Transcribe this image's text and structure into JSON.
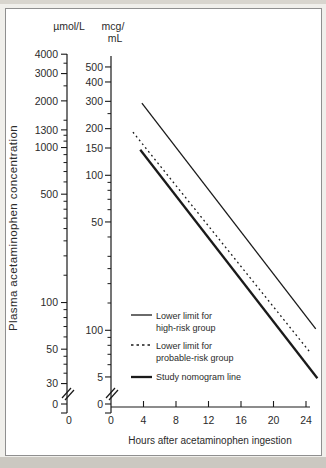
{
  "colors": {
    "line": "#1a1a1a",
    "text": "#2b2b2b",
    "frame": "#8f8f8f",
    "figure_bg": "#ffffff",
    "page_bg": "#f0efeb"
  },
  "chart_data": {
    "type": "line",
    "title": "",
    "y_scale": "log",
    "y_axis_title": "Plasma acetaminophen concentration",
    "y_axes": [
      {
        "unit_label": "µmol/L",
        "tick_labels": [
          "4000",
          "3000",
          "2000",
          "1300",
          "1000",
          "500",
          "100",
          "50",
          "30",
          "0"
        ],
        "tick_values": [
          4000,
          3000,
          2000,
          1300,
          1000,
          500,
          100,
          50,
          30,
          0
        ],
        "minor_tick_values": [
          3500,
          2500,
          1500,
          1200,
          1100,
          900,
          800,
          700,
          600,
          450,
          400,
          350,
          300,
          250,
          200,
          150,
          90,
          80,
          70,
          60,
          45,
          40,
          35
        ],
        "axis_break_above_zero": true
      },
      {
        "unit_lines": [
          "mcg/",
          "mL"
        ],
        "tick_labels": [
          "500",
          "400",
          "300",
          "200",
          "150",
          "100",
          "50",
          "100",
          "5",
          "0"
        ],
        "tick_values": [
          500,
          400,
          300,
          200,
          150,
          100,
          50,
          10,
          5,
          0
        ],
        "minor_tick_values": [
          250,
          90,
          80,
          70,
          60,
          40,
          30,
          25,
          20,
          15,
          9,
          8,
          7,
          6
        ],
        "axis_break_above_zero": true
      }
    ],
    "x_axis": {
      "title": "Hours after acetaminophen ingestion",
      "tick_labels": [
        "0",
        "4",
        "8",
        "12",
        "16",
        "20",
        "24"
      ],
      "tick_values": [
        0,
        4,
        8,
        12,
        16,
        20,
        24
      ],
      "range_hours": [
        0,
        24
      ],
      "extra_zero_label_under_umol_axis": "0"
    },
    "series": [
      {
        "name": "Lower limit for high-risk group",
        "style": "solid-thin",
        "points": [
          {
            "hours": 3.8,
            "mcg_per_ml": 292
          },
          {
            "hours": 25.2,
            "mcg_per_ml": 10.2
          }
        ]
      },
      {
        "name": "Lower limit for probable-risk group",
        "style": "dashed",
        "points": [
          {
            "hours": 2.7,
            "mcg_per_ml": 190
          },
          {
            "hours": 24.6,
            "mcg_per_ml": 7.1
          }
        ]
      },
      {
        "name": "Study nomogram line",
        "style": "solid-thick",
        "points": [
          {
            "hours": 3.6,
            "mcg_per_ml": 146
          },
          {
            "hours": 25.4,
            "mcg_per_ml": 4.9
          }
        ]
      }
    ],
    "legend": {
      "position": "lower-center",
      "entries": [
        {
          "style": "solid-thin",
          "lines": [
            "Lower limit for",
            "high-risk group"
          ]
        },
        {
          "style": "dashed",
          "lines": [
            "Lower limit for",
            "probable-risk group"
          ]
        },
        {
          "style": "solid-thick",
          "lines": [
            "Study nomogram line"
          ]
        }
      ]
    }
  }
}
